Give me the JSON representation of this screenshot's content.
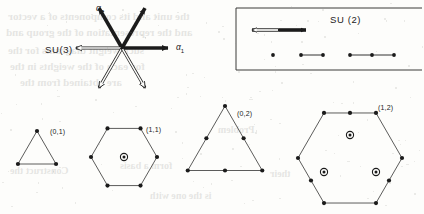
{
  "figure": {
    "background_color": "#fdfdfb",
    "ink_color": "#1b1b1b"
  },
  "su3_roots": {
    "label": "SU(3)",
    "label_x": 45,
    "label_y": 44,
    "origin_x": 122,
    "origin_y": 48,
    "arrow_length": 46,
    "root_labels": [
      {
        "name": "alpha-1",
        "text": "α",
        "sub": "1",
        "x": 176,
        "y": 42
      },
      {
        "name": "alpha-2",
        "text": "α",
        "sub": "2",
        "x": 96,
        "y": 3
      }
    ],
    "arrows": [
      {
        "name": "root-alpha1-positive",
        "angle_deg": 0,
        "style": "filled"
      },
      {
        "name": "root-up-right-positive",
        "angle_deg": -60,
        "style": "filled"
      },
      {
        "name": "root-alpha2-positive",
        "angle_deg": -120,
        "style": "filled"
      },
      {
        "name": "root-alpha1-negative",
        "angle_deg": 180,
        "style": "hollow"
      },
      {
        "name": "root-down-left-negative",
        "angle_deg": 120,
        "style": "hollow"
      },
      {
        "name": "root-alpha2-negative",
        "angle_deg": 60,
        "style": "hollow"
      }
    ]
  },
  "su2_panel": {
    "label": "SU (2)",
    "label_x": 330,
    "label_y": 14,
    "box": {
      "x": 236,
      "y": 8,
      "width": 186,
      "height": 62
    },
    "root_arrow": {
      "name": "su2-root-arrow",
      "x1": 252,
      "x2": 306,
      "y": 30,
      "left_half_style": "hollow",
      "right_half_style": "filled"
    },
    "weight_diagrams": [
      {
        "name": "su2-weight-singlet",
        "dots": 1,
        "x_start": 273,
        "y": 55,
        "spacing": 0
      },
      {
        "name": "su2-weight-doublet",
        "dots": 2,
        "x_start": 301,
        "y": 55,
        "spacing": 22
      },
      {
        "name": "su2-weight-triplet",
        "dots": 3,
        "x_start": 350,
        "y": 55,
        "spacing": 22
      }
    ]
  },
  "su3_weight_diagrams": [
    {
      "name": "weight-diagram-0-1",
      "label": "(0,1)",
      "label_x": 50,
      "label_y": 128,
      "shape": "triangle",
      "center_x": 37,
      "center_y": 153,
      "radius": 22,
      "orientation_deg": -90,
      "edge_subdivisions": 1,
      "interior_points": []
    },
    {
      "name": "weight-diagram-1-1",
      "label": "(1,1)",
      "label_x": 146,
      "label_y": 126,
      "shape": "hexagon",
      "center_x": 124,
      "center_y": 157,
      "radius": 33,
      "orientation_deg": 0,
      "edge_subdivisions": 1,
      "interior_points": [
        {
          "name": "degenerate-weight-center",
          "dx": 0,
          "dy": 0,
          "multiplicity": 2
        }
      ]
    },
    {
      "name": "weight-diagram-0-2",
      "label": "(0,2)",
      "label_x": 237,
      "label_y": 110,
      "shape": "triangle",
      "center_x": 225,
      "center_y": 149,
      "radius": 43,
      "orientation_deg": -90,
      "edge_subdivisions": 2,
      "interior_points": []
    },
    {
      "name": "weight-diagram-1-2",
      "label": "(1,2)",
      "label_x": 378,
      "label_y": 104,
      "shape": "hexagon",
      "center_x": 350,
      "center_y": 158,
      "radius": 52,
      "orientation_deg": 0,
      "edge_subdivisions_long": 2,
      "edge_subdivisions_short": 1,
      "interior_points": [
        {
          "name": "degenerate-weight-upper",
          "dx": 0,
          "dy": -23,
          "multiplicity": 2
        },
        {
          "name": "degenerate-weight-lower-left",
          "dx": -26,
          "dy": 14,
          "multiplicity": 2
        },
        {
          "name": "degenerate-weight-lower-right",
          "dx": 26,
          "dy": 14,
          "multiplicity": 2
        }
      ]
    }
  ],
  "bleed_through_lines": [
    {
      "text": "the unit and its components of a vector",
      "x": 8,
      "y": 10,
      "size": 11
    },
    {
      "text": "and the representation of the group and",
      "x": 6,
      "y": 26,
      "size": 11
    },
    {
      "text": "such weight  diagrams  for  the",
      "x": 8,
      "y": 44,
      "size": 11
    },
    {
      "text": "for each of the  weights in the",
      "x": 10,
      "y": 60,
      "size": 11
    },
    {
      "text": "are obtained from the",
      "x": 20,
      "y": 76,
      "size": 11
    },
    {
      "text": "their",
      "x": 270,
      "y": 168,
      "size": 10
    },
    {
      "text": "form a basis",
      "x": 120,
      "y": 160,
      "size": 10
    },
    {
      "text": "Problem",
      "x": 218,
      "y": 124,
      "size": 10
    },
    {
      "text": "is the one with",
      "x": 150,
      "y": 190,
      "size": 10
    },
    {
      "text": "Construct the",
      "x": 10,
      "y": 165,
      "size": 10
    }
  ]
}
